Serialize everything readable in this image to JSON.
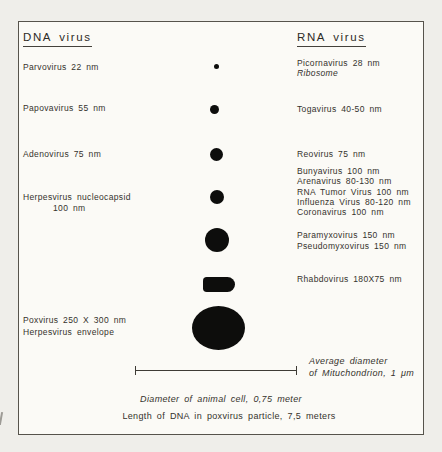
{
  "headers": {
    "dna": "DNA virus",
    "rna": "RNA virus"
  },
  "dna": {
    "parvovirus": "Parvovirus 22 nm",
    "papovavirus": "Papovavirus 55 nm",
    "adenovirus": "Adenovirus 75 nm",
    "herpesvirus_line1": "Herpesvirus nucleocapsid",
    "herpesvirus_line2": "100 nm",
    "poxvirus_line1": "Poxvirus 250 X 300 nm",
    "poxvirus_line2": "Herpesvirus envelope"
  },
  "rna": {
    "picornavirus": "Picornavirus 28 nm",
    "ribosome": "Ribosome",
    "togavirus": "Togavirus 40-50 nm",
    "reovirus": "Reovirus 75 nm",
    "group_100nm": [
      "Bunyavirus 100 nm",
      "Arenavirus 80-130 nm",
      "RNA Tumor Virus 100 nm",
      "Influenza Virus 80-120 nm",
      "Coronavirus 100 nm"
    ],
    "paramyxovirus": "Paramyxovirus 150 nm",
    "pseudomyxovirus": "Pseudomyxovirus 150 nm",
    "rhabdovirus": "Rhabdovirus 180X75 nm"
  },
  "scale_bar": {
    "caption_line1": "Average diameter",
    "caption_line2": "of Mituchondrion, 1 μm"
  },
  "footnotes": {
    "animal_cell": "Diameter of animal cell, 0,75 meter",
    "dna_length": "Length of DNA in poxvirus particle, 7,5 meters"
  },
  "shapes": {
    "colors": {
      "shape_fill": "#0d0d0c",
      "background": "#fbfaf6",
      "frame_border": "#56534c"
    },
    "items": [
      {
        "name": "parvovirus-picornavirus-dot",
        "type": "filled-circle"
      },
      {
        "name": "papovavirus-togavirus-dot",
        "type": "filled-circle"
      },
      {
        "name": "adenovirus-reovirus-dot",
        "type": "filled-circle"
      },
      {
        "name": "herpesvirus-nucleocapsid-dot",
        "type": "filled-circle"
      },
      {
        "name": "paramyxovirus-dot",
        "type": "filled-circle"
      },
      {
        "name": "rhabdovirus-bullet",
        "type": "bullet-shape"
      },
      {
        "name": "poxvirus-ellipse",
        "type": "filled-ellipse"
      }
    ]
  }
}
